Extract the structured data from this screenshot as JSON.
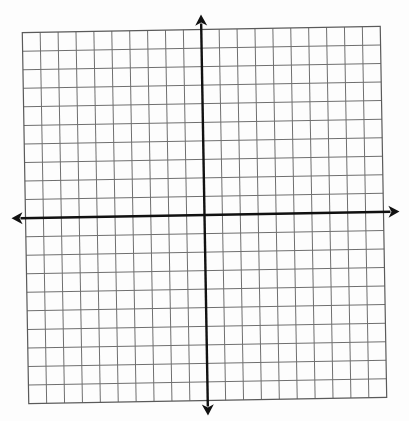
{
  "diagram": {
    "type": "coordinate-plane",
    "grid": {
      "columns": 20,
      "rows": 20,
      "center_px": [
        204.5,
        215
      ],
      "width_px": 358,
      "height_px": 371,
      "rotation_deg": -1.0,
      "line_color": "#6f6f6f"
    },
    "axes": {
      "color": "#111111",
      "x_axis": {
        "row_index": 10,
        "left_tip_extension_px": 14,
        "right_tip_extension_px": 16
      },
      "y_axis": {
        "col_index": 10,
        "top_tip_extension_px": 15,
        "bottom_tip_extension_px": 15
      }
    },
    "labels": []
  }
}
